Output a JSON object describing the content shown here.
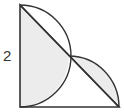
{
  "figure": {
    "type": "geometry",
    "side_label": "2",
    "colors": {
      "stroke": "#333333",
      "shade": "#ececec",
      "background": "#ffffff"
    },
    "vertices": {
      "top_left": [
        20,
        5
      ],
      "bottom_left": [
        20,
        107
      ],
      "bottom_right": [
        119,
        107
      ],
      "hypotenuse_midpoint": [
        69,
        56
      ]
    }
  }
}
